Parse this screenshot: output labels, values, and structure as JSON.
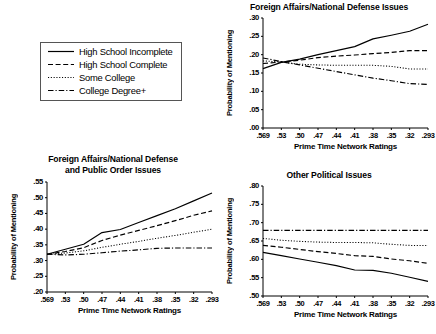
{
  "legend": {
    "name": "chart-legend",
    "items": [
      {
        "label": "High School Incomplete",
        "style": "solid",
        "icon": "solid-line-icon"
      },
      {
        "label": "High School Complete",
        "style": "dashed",
        "icon": "dashed-line-icon"
      },
      {
        "label": "Some College",
        "style": "dotted",
        "icon": "dotted-line-icon"
      },
      {
        "label": "College Degree+",
        "style": "dashdot",
        "icon": "dash-dot-line-icon"
      }
    ]
  },
  "common": {
    "ylabel": "Probability of Mentioning",
    "xlabel": "Prime Time Network Ratings",
    "xticks": [
      ".569",
      ".53",
      ".50",
      ".47",
      ".44",
      ".41",
      ".38",
      ".35",
      ".32",
      ".293"
    ]
  },
  "chart_data": [
    {
      "id": "foreign-affairs-national-defense",
      "type": "line",
      "title": "Foreign Affairs/National Defense Issues",
      "xlabel": "Prime Time Network Ratings",
      "ylabel": "Probability of Mentioning",
      "x": [
        0.569,
        0.53,
        0.5,
        0.47,
        0.44,
        0.41,
        0.38,
        0.35,
        0.32,
        0.293
      ],
      "xticklabels": [
        ".569",
        ".53",
        ".50",
        ".47",
        ".44",
        ".41",
        ".38",
        ".35",
        ".32",
        ".293"
      ],
      "yticklabels": [
        ".00",
        ".05",
        ".10",
        ".15",
        ".20",
        ".25",
        ".30"
      ],
      "ylim": [
        0.0,
        0.3
      ],
      "grid": false,
      "legend_position": "external-top-left",
      "series": [
        {
          "name": "High School Incomplete",
          "style": "solid",
          "values": [
            0.162,
            0.179,
            0.188,
            0.2,
            0.211,
            0.222,
            0.243,
            0.253,
            0.264,
            0.283
          ]
        },
        {
          "name": "High School Complete",
          "style": "dashed",
          "values": [
            0.176,
            0.18,
            0.185,
            0.192,
            0.196,
            0.199,
            0.203,
            0.206,
            0.211,
            0.211
          ]
        },
        {
          "name": "Some College",
          "style": "dotted",
          "values": [
            0.183,
            0.18,
            0.174,
            0.172,
            0.171,
            0.171,
            0.171,
            0.168,
            0.161,
            0.161
          ]
        },
        {
          "name": "College Degree+",
          "style": "dashdot",
          "values": [
            0.191,
            0.181,
            0.172,
            0.163,
            0.154,
            0.145,
            0.136,
            0.129,
            0.121,
            0.119
          ]
        }
      ]
    },
    {
      "id": "foreign-affairs-public-order",
      "type": "line",
      "title": "Foreign Affairs/National Defense\nand Public Order Issues",
      "xlabel": "Prime Time Network Ratings",
      "ylabel": "Probability of Mentioning",
      "x": [
        0.569,
        0.53,
        0.5,
        0.47,
        0.44,
        0.41,
        0.38,
        0.35,
        0.32,
        0.293
      ],
      "xticklabels": [
        ".569",
        ".53",
        ".50",
        ".47",
        ".44",
        ".41",
        ".38",
        ".35",
        ".32",
        ".293"
      ],
      "yticklabels": [
        ".20",
        ".25",
        ".30",
        ".35",
        ".40",
        ".45",
        ".50",
        ".55"
      ],
      "ylim": [
        0.2,
        0.55
      ],
      "grid": false,
      "legend_position": "external-top-left",
      "series": [
        {
          "name": "High School Incomplete",
          "style": "solid",
          "values": [
            0.32,
            0.336,
            0.352,
            0.389,
            0.399,
            0.421,
            0.443,
            0.465,
            0.49,
            0.515
          ]
        },
        {
          "name": "High School Complete",
          "style": "dashed",
          "values": [
            0.32,
            0.329,
            0.341,
            0.364,
            0.381,
            0.396,
            0.411,
            0.427,
            0.444,
            0.458
          ]
        },
        {
          "name": "Some College",
          "style": "dotted",
          "values": [
            0.32,
            0.324,
            0.331,
            0.342,
            0.352,
            0.361,
            0.371,
            0.38,
            0.39,
            0.4
          ]
        },
        {
          "name": "College Degree+",
          "style": "dashdot",
          "values": [
            0.32,
            0.318,
            0.32,
            0.325,
            0.33,
            0.334,
            0.339,
            0.34,
            0.34,
            0.34
          ]
        }
      ]
    },
    {
      "id": "other-political-issues",
      "type": "line",
      "title": "Other Political Issues",
      "xlabel": "Prime Time Network Ratings",
      "ylabel": "Probability of Mentioning",
      "x": [
        0.569,
        0.53,
        0.5,
        0.47,
        0.44,
        0.41,
        0.38,
        0.35,
        0.32,
        0.293
      ],
      "xticklabels": [
        ".569",
        ".53",
        ".50",
        ".47",
        ".44",
        ".41",
        ".38",
        ".35",
        ".32",
        ".293"
      ],
      "yticklabels": [
        ".50",
        ".55",
        ".60",
        ".65",
        ".70",
        ".75",
        ".80"
      ],
      "ylim": [
        0.5,
        0.8
      ],
      "grid": false,
      "legend_position": "external-top-left",
      "series": [
        {
          "name": "High School Incomplete",
          "style": "solid",
          "values": [
            0.619,
            0.61,
            0.601,
            0.592,
            0.583,
            0.571,
            0.57,
            0.562,
            0.551,
            0.54
          ]
        },
        {
          "name": "High School Complete",
          "style": "dashed",
          "values": [
            0.638,
            0.633,
            0.627,
            0.621,
            0.616,
            0.61,
            0.608,
            0.601,
            0.596,
            0.589
          ]
        },
        {
          "name": "Some College",
          "style": "dotted",
          "values": [
            0.657,
            0.652,
            0.649,
            0.647,
            0.646,
            0.646,
            0.645,
            0.641,
            0.638,
            0.638
          ]
        },
        {
          "name": "College Degree+",
          "style": "dashdot",
          "values": [
            0.679,
            0.679,
            0.679,
            0.679,
            0.679,
            0.679,
            0.679,
            0.679,
            0.679,
            0.679
          ]
        }
      ]
    }
  ]
}
